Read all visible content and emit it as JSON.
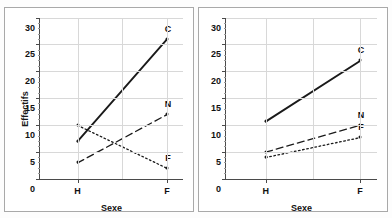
{
  "figure": {
    "background": "#fdfdfd",
    "panel_border_color": "#a9a9a9",
    "axis_color": "#4a4a4a",
    "grid_color": "#d8d8d8",
    "series_color": "#1a1a1a"
  },
  "chart_data": [
    {
      "type": "line",
      "title": "",
      "xlabel": "Sexe",
      "ylabel": "Effectifs",
      "categories": [
        "H",
        "F"
      ],
      "x": [
        0,
        1
      ],
      "xlim": [
        -0.42,
        1.18
      ],
      "ylim": [
        0,
        30
      ],
      "yticks": [
        0,
        5,
        10,
        15,
        20,
        25,
        30
      ],
      "ytick_labels": [
        "0",
        "5",
        "10",
        "15",
        "20",
        "25",
        "30"
      ],
      "grid": true,
      "legend": "inline-point-labels",
      "series": [
        {
          "name": "C",
          "label": "C",
          "style": "solid",
          "values": [
            7,
            26
          ]
        },
        {
          "name": "N",
          "label": "N",
          "style": "dashed",
          "values": [
            3,
            12
          ]
        },
        {
          "name": "F",
          "label": "F",
          "style": "dotted",
          "values": [
            10,
            2
          ]
        }
      ]
    },
    {
      "type": "line",
      "title": "",
      "xlabel": "Sexe",
      "ylabel": "",
      "categories": [
        "H",
        "F"
      ],
      "x": [
        0,
        1
      ],
      "xlim": [
        -0.42,
        1.18
      ],
      "ylim": [
        0,
        30
      ],
      "yticks": [
        0,
        5,
        10,
        15,
        20,
        25,
        30
      ],
      "ytick_labels": [
        "0",
        "5",
        "10",
        "15",
        "20",
        "25",
        "30"
      ],
      "grid": true,
      "legend": "inline-point-labels",
      "series": [
        {
          "name": "C",
          "label": "C",
          "style": "solid",
          "values": [
            10.7,
            22
          ]
        },
        {
          "name": "N",
          "label": "N",
          "style": "dashed",
          "values": [
            5,
            10
          ]
        },
        {
          "name": "F",
          "label": "F",
          "style": "dotted",
          "values": [
            4,
            7.7
          ]
        }
      ]
    }
  ],
  "panels": [
    {
      "id": "left-interaction-plot",
      "ylabel": "Effectifs",
      "xtitle": "Sexe",
      "show_ylabel": true
    },
    {
      "id": "right-interaction-plot",
      "ylabel": "",
      "xtitle": "Sexe",
      "show_ylabel": false
    }
  ]
}
